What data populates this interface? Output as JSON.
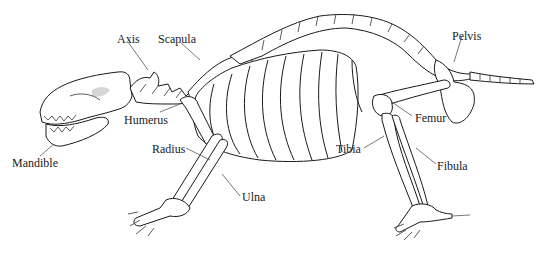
{
  "figure": {
    "labels": [
      {
        "id": "axis",
        "text": "Axis",
        "x": 117,
        "y": 33
      },
      {
        "id": "scapula",
        "text": "Scapula",
        "x": 158,
        "y": 33
      },
      {
        "id": "pelvis",
        "text": "Pelvis",
        "x": 452,
        "y": 30
      },
      {
        "id": "humerus",
        "text": "Humerus",
        "x": 124,
        "y": 114
      },
      {
        "id": "radius",
        "text": "Radius",
        "x": 152,
        "y": 143
      },
      {
        "id": "mandible",
        "text": "Mandible",
        "x": 12,
        "y": 157
      },
      {
        "id": "femur",
        "text": "Femur",
        "x": 415,
        "y": 112
      },
      {
        "id": "tibia",
        "text": "Tibia",
        "x": 336,
        "y": 143
      },
      {
        "id": "fibula",
        "text": "Fibula",
        "x": 437,
        "y": 160
      },
      {
        "id": "ulna",
        "text": "Ulna",
        "x": 242,
        "y": 191
      }
    ]
  }
}
